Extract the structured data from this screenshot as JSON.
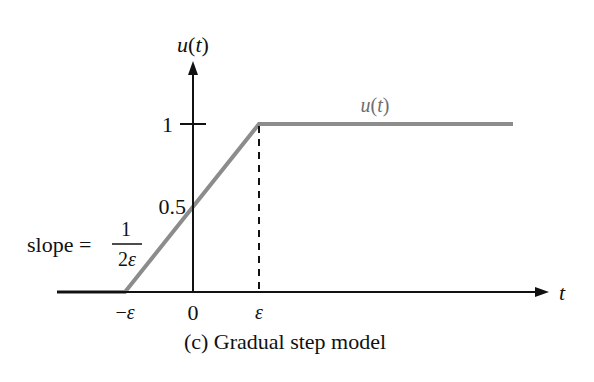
{
  "figure": {
    "caption": "(c) Gradual step model",
    "y_axis_label": "u(t)",
    "x_axis_label": "t",
    "curve_label": "u(t)",
    "y_ticks": [
      {
        "label": "1",
        "value": 1
      },
      {
        "label": "0.5",
        "value": 0.5
      }
    ],
    "x_ticks": [
      {
        "label": "−ε",
        "value": "-epsilon"
      },
      {
        "label": "0",
        "value": 0
      },
      {
        "label": "ε",
        "value": "epsilon"
      }
    ],
    "slope_annotation": {
      "prefix": "slope =",
      "numerator": "1",
      "denominator": "2ε"
    },
    "colors": {
      "axis": "#111111",
      "curve": "#8c8c8c",
      "text": "#111111",
      "curve_label": "#6e6e6e"
    }
  }
}
